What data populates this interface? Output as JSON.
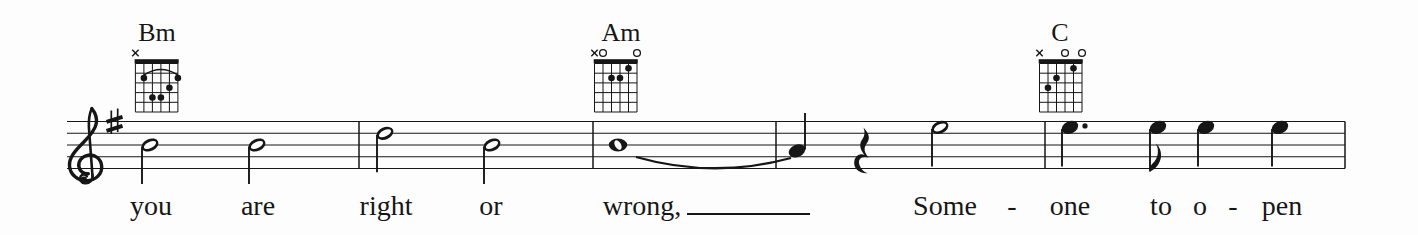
{
  "colors": {
    "ink": "#161616",
    "background": "#fdfdfd"
  },
  "score": {
    "clef": "treble",
    "key_signature": "1 sharp (F#)",
    "chords": [
      {
        "name": "Bm",
        "label_x": 157,
        "grid_left": 135.4,
        "voicing": "x24432",
        "markers": [
          "x",
          "",
          "",
          "",
          "",
          ""
        ],
        "dots": [
          [
            2,
            2
          ],
          [
            3,
            4
          ],
          [
            4,
            4
          ],
          [
            5,
            3
          ],
          [
            6,
            2
          ]
        ],
        "barre": {
          "from": 2,
          "to": 6,
          "fret": 2
        }
      },
      {
        "name": "Am",
        "label_x": 621,
        "grid_left": 594.5,
        "voicing": "x02210",
        "markers": [
          "x",
          "o",
          "",
          "",
          "",
          "o"
        ],
        "dots": [
          [
            3,
            2
          ],
          [
            4,
            2
          ],
          [
            5,
            1
          ]
        ]
      },
      {
        "name": "C",
        "label_x": 1060,
        "grid_left": 1039.5,
        "voicing": "x32010",
        "markers": [
          "x",
          "",
          "",
          "o",
          "",
          "o"
        ],
        "dots": [
          [
            2,
            3
          ],
          [
            3,
            2
          ],
          [
            5,
            1
          ]
        ]
      }
    ],
    "staff": {
      "x_start": 67,
      "x_end": 1345,
      "lines_y": [
        121.5,
        133.3,
        145.0,
        156.7,
        168.5
      ],
      "barlines": [
        359,
        593,
        776,
        1045,
        1345
      ]
    },
    "notes": [
      {
        "x": 150,
        "pitch": "B4",
        "duration": "half",
        "stem": "down"
      },
      {
        "x": 257,
        "pitch": "B4",
        "duration": "half",
        "stem": "down"
      },
      {
        "x": 385,
        "pitch": "D5",
        "duration": "half",
        "stem": "down"
      },
      {
        "x": 492,
        "pitch": "B4",
        "duration": "half",
        "stem": "down"
      },
      {
        "x": 618,
        "pitch": "B4",
        "duration": "whole"
      },
      {
        "x": 797,
        "pitch": "A4",
        "duration": "quarter",
        "stem": "up"
      },
      {
        "x": 868,
        "rest": "quarter"
      },
      {
        "x": 940,
        "pitch": "E5",
        "duration": "half",
        "stem": "down"
      },
      {
        "x": 1070,
        "pitch": "E5",
        "duration": "quarter",
        "dotted": true,
        "stem": "down"
      },
      {
        "x": 1158,
        "pitch": "E5",
        "duration": "eighth",
        "stem": "down"
      },
      {
        "x": 1206,
        "pitch": "E5",
        "duration": "quarter",
        "stem": "down"
      },
      {
        "x": 1280,
        "pitch": "E5",
        "duration": "quarter",
        "stem": "down"
      }
    ],
    "slur": {
      "from_x": 636,
      "to_x": 791
    },
    "lyric_extender": {
      "from_x": 687,
      "to_x": 810,
      "y": 214
    },
    "lyrics": [
      {
        "text": "you",
        "x": 151
      },
      {
        "text": "are",
        "x": 258
      },
      {
        "text": "right",
        "x": 386
      },
      {
        "text": "or",
        "x": 491
      },
      {
        "text": "wrong,",
        "x": 642
      },
      {
        "text": "Some",
        "x": 945
      },
      {
        "text": "-",
        "x": 1012
      },
      {
        "text": "one",
        "x": 1070
      },
      {
        "text": "to",
        "x": 1161
      },
      {
        "text": "o",
        "x": 1200
      },
      {
        "text": "-",
        "x": 1233
      },
      {
        "text": "pen",
        "x": 1282
      }
    ]
  }
}
